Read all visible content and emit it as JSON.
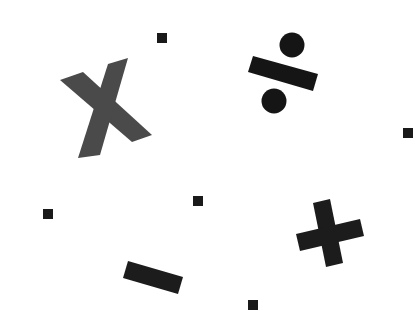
{
  "scene": {
    "background": "#ffffff",
    "description": "Math operator symbols scattered on a white background",
    "symbols": [
      {
        "name": "multiply",
        "glyph": "×",
        "color": "#4a4a4a"
      },
      {
        "name": "divide",
        "glyph": "÷",
        "color": "#151515"
      },
      {
        "name": "plus",
        "glyph": "+",
        "color": "#1c1c1c"
      },
      {
        "name": "minus",
        "glyph": "−",
        "color": "#1c1c1c"
      }
    ],
    "dots": [
      {
        "x": 157,
        "y": 33,
        "size": 10,
        "color": "#1a1a1a"
      },
      {
        "x": 403,
        "y": 128,
        "size": 10,
        "color": "#1a1a1a"
      },
      {
        "x": 43,
        "y": 209,
        "size": 10,
        "color": "#1a1a1a"
      },
      {
        "x": 193,
        "y": 196,
        "size": 10,
        "color": "#1a1a1a"
      },
      {
        "x": 248,
        "y": 300,
        "size": 10,
        "color": "#1a1a1a"
      }
    ]
  }
}
